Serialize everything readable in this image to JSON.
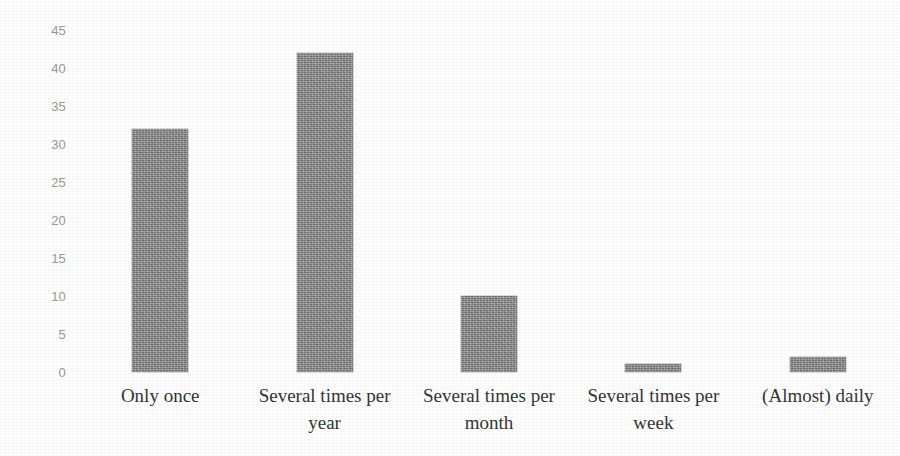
{
  "chart_data": {
    "type": "bar",
    "title": "",
    "subtitle": "",
    "xlabel": "",
    "ylabel": "",
    "categories": [
      "Only once",
      "Several times per year",
      "Several times per month",
      "Several times per week",
      "(Almost) daily"
    ],
    "values": [
      32,
      42,
      10,
      1,
      2
    ],
    "ylim": [
      0,
      45
    ],
    "ytick_step": 5,
    "yticks": [
      45,
      40,
      35,
      30,
      25,
      20,
      15,
      10,
      5,
      0
    ],
    "ytick_labels": [
      "45",
      "40",
      "35",
      "30",
      "25",
      "20",
      "15",
      "10",
      "5",
      "0"
    ],
    "grid": false,
    "legend": false,
    "legend_position": "none",
    "bar_color": "#8b8b8b",
    "tick_label_color": "#9a9a9a",
    "category_label_color": "#353535",
    "background_color": "#ffffff",
    "series": [
      {
        "name": "Frequency of use",
        "values": [
          32,
          42,
          10,
          1,
          2
        ]
      }
    ]
  }
}
